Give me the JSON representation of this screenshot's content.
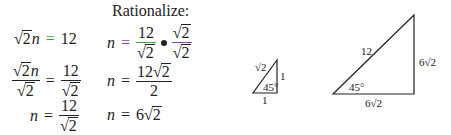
{
  "heading": "Rationalize:",
  "left_column": {
    "step1": {
      "lhs_root": "2",
      "lhs_var": "n",
      "eq": "=",
      "rhs": "12"
    },
    "step2": {
      "lhs_num_root": "2",
      "lhs_num_var": "n",
      "lhs_den_root": "2",
      "eq": "=",
      "rhs_num": "12",
      "rhs_den_root": "2"
    },
    "step3": {
      "lhs": "n",
      "eq": "=",
      "rhs_num": "12",
      "rhs_den_root": "2"
    }
  },
  "right_column": {
    "step1": {
      "lhs": "n",
      "eq": "=",
      "f1_num": "12",
      "f1_den_root": "2",
      "f2_num_root": "2",
      "f2_den_root": "2"
    },
    "step2": {
      "lhs": "n",
      "eq": "=",
      "num_coef": "12",
      "num_root": "2",
      "den": "2"
    },
    "step3": {
      "lhs": "n",
      "eq": "=",
      "coef": "6",
      "root": "2"
    }
  },
  "colors": {
    "equals_highlight": "#3aa640",
    "fraction_bar_green": "#3aa640",
    "fraction_bar_purple": "#8a3fa8"
  },
  "triangles": {
    "small": {
      "hypotenuse": "√2",
      "vertical_leg": "1",
      "horizontal_leg": "1",
      "angle": "45°"
    },
    "large": {
      "hypotenuse": "12",
      "vertical_leg": "6√2",
      "horizontal_leg": "6√2",
      "angle": "45°"
    }
  },
  "symbols": {
    "radical": "√",
    "times_dot": "•"
  }
}
